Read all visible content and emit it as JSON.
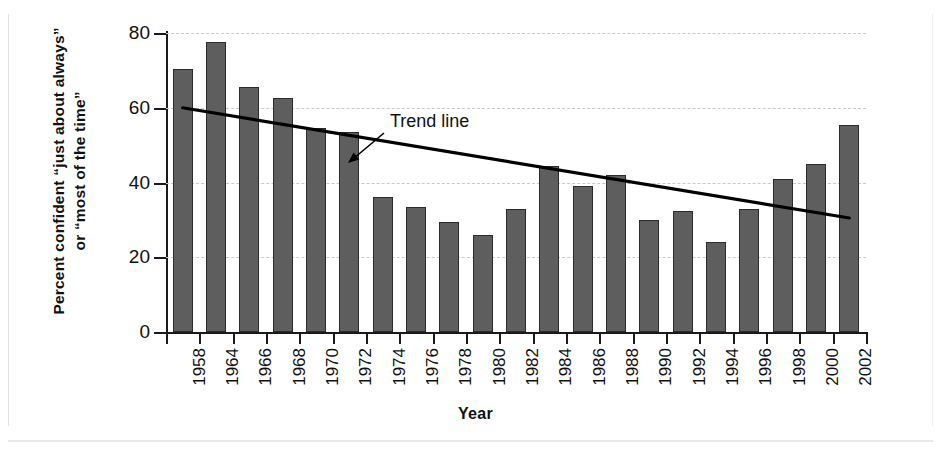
{
  "chart_data": {
    "type": "bar",
    "title": "",
    "xlabel": "Year",
    "ylabel": "Percent confident “just about always” or “most of the time”",
    "ylabel_line1": "Percent confident “just about always”",
    "ylabel_line2": "or “most of the time”",
    "categories": [
      "1958",
      "1964",
      "1966",
      "1968",
      "1970",
      "1972",
      "1974",
      "1976",
      "1978",
      "1980",
      "1982",
      "1984",
      "1986",
      "1988",
      "1990",
      "1992",
      "1994",
      "1996",
      "1998",
      "2000",
      "2002"
    ],
    "values": [
      70.5,
      77.5,
      65.5,
      62.5,
      54.5,
      53.5,
      36.0,
      33.5,
      29.5,
      26.0,
      33.0,
      44.5,
      39.0,
      42.0,
      30.0,
      32.5,
      24.0,
      33.0,
      41.0,
      45.0,
      55.5
    ],
    "ylim": [
      0,
      80
    ],
    "yticks": [
      0,
      20,
      40,
      60,
      80
    ],
    "ytick_labels": [
      "0",
      "20",
      "40",
      "60",
      "80"
    ],
    "grid": "horizontal-dashed",
    "legend": "none",
    "bar_color": "#5e5e5e",
    "bar_edge_color": "#2b2b2b",
    "grid_color": "#c9c9c9",
    "axis_color": "#1a1a1a",
    "annotations": [
      {
        "label": "Trend line",
        "kind": "arrow-callout",
        "text_x": 390,
        "text_y": 111
      }
    ],
    "series": [
      {
        "name": "Trend line",
        "type": "line",
        "color": "#000000",
        "start": {
          "year": "1958",
          "value": 60.0
        },
        "end": {
          "year": "2002",
          "value": 30.5
        }
      }
    ]
  }
}
